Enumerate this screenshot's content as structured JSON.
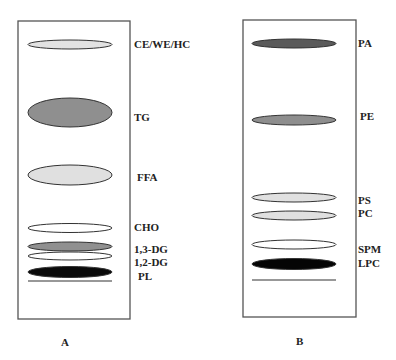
{
  "figure": {
    "type": "thin-layer chromatography plates",
    "panels": [
      {
        "id": "A",
        "label": "A",
        "plate": {
          "x": 18,
          "y": 21,
          "w": 112,
          "h": 298
        },
        "label_pos": {
          "x": 61,
          "y": 346
        },
        "baseline_y": 281,
        "spots": [
          {
            "name": "CE/WE/HC",
            "cx": 70,
            "cy": 44.5,
            "rx": 42,
            "ry": 4.5,
            "fill": "#e2e2e2",
            "label_x": 134,
            "label_y": 48
          },
          {
            "name": "TG",
            "cx": 70,
            "cy": 112.5,
            "rx": 42,
            "ry": 14.5,
            "fill": "#8f8f8f",
            "label_x": 134,
            "label_y": 121
          },
          {
            "name": "FFA",
            "cx": 70,
            "cy": 175,
            "rx": 42,
            "ry": 10,
            "fill": "#e0e0e0",
            "label_x": 137,
            "label_y": 181
          },
          {
            "name": "CHO",
            "cx": 70,
            "cy": 228,
            "rx": 42,
            "ry": 4.5,
            "fill": "#ffffff",
            "label_x": 134,
            "label_y": 231
          },
          {
            "name": "1,3-DG",
            "cx": 70,
            "cy": 246.5,
            "rx": 42,
            "ry": 4.5,
            "fill": "#909090",
            "label_x": 134,
            "label_y": 253
          },
          {
            "name": "1,2-DG",
            "cx": 70,
            "cy": 256,
            "rx": 42,
            "ry": 4,
            "fill": "#ffffff",
            "label_x": 134,
            "label_y": 266
          },
          {
            "name": "PL",
            "cx": 70,
            "cy": 272,
            "rx": 42,
            "ry": 5.5,
            "fill": "#0a0a0a",
            "label_x": 138,
            "label_y": 280
          }
        ]
      },
      {
        "id": "B",
        "label": "B",
        "plate": {
          "x": 243,
          "y": 20,
          "w": 113,
          "h": 297
        },
        "label_pos": {
          "x": 296,
          "y": 345
        },
        "baseline_y": 280,
        "spots": [
          {
            "name": "PA",
            "cx": 294,
            "cy": 43.5,
            "rx": 42,
            "ry": 4.5,
            "fill": "#5a5a5a",
            "label_x": 358,
            "label_y": 47
          },
          {
            "name": "PE",
            "cx": 294,
            "cy": 120,
            "rx": 42,
            "ry": 5,
            "fill": "#8e8e8e",
            "label_x": 360,
            "label_y": 120
          },
          {
            "name": "PS",
            "cx": 294,
            "cy": 197.5,
            "rx": 42,
            "ry": 4.5,
            "fill": "#e0e0e0",
            "label_x": 358,
            "label_y": 204
          },
          {
            "name": "PC",
            "cx": 294,
            "cy": 215.5,
            "rx": 42,
            "ry": 4.5,
            "fill": "#e0e0e0",
            "label_x": 358,
            "label_y": 217
          },
          {
            "name": "SPM",
            "cx": 294,
            "cy": 244.5,
            "rx": 42,
            "ry": 4.5,
            "fill": "#ffffff",
            "label_x": 358,
            "label_y": 253
          },
          {
            "name": "LPC",
            "cx": 294,
            "cy": 264,
            "rx": 42,
            "ry": 5.5,
            "fill": "#050505",
            "label_x": 358,
            "label_y": 267
          }
        ]
      }
    ]
  },
  "labels": {
    "A": "A",
    "B": "B",
    "a_spots": [
      "CE/WE/HC",
      "TG",
      "FFA",
      "CHO",
      "1,3-DG",
      "1,2-DG",
      "PL"
    ],
    "b_spots": [
      "PA",
      "PE",
      "PS",
      "PC",
      "SPM",
      "LPC"
    ]
  },
  "colors": {
    "plate_border": "#555555",
    "spot_stroke": "#333333",
    "text": "#222222"
  }
}
